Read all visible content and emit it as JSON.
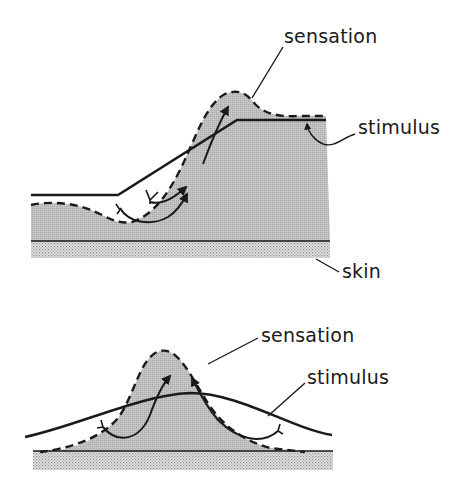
{
  "figure": {
    "top_panel": {
      "labels": {
        "sensation": "sensation",
        "stimulus": "stimulus",
        "skin": "skin"
      }
    },
    "bottom_panel": {
      "labels": {
        "sensation": "sensation",
        "stimulus": "stimulus"
      }
    },
    "colors": {
      "ink": "#1a1a1a",
      "sensation_fill": "#bdbdbd",
      "skin_stipple": "#c8c8c8",
      "background": "#ffffff"
    }
  }
}
